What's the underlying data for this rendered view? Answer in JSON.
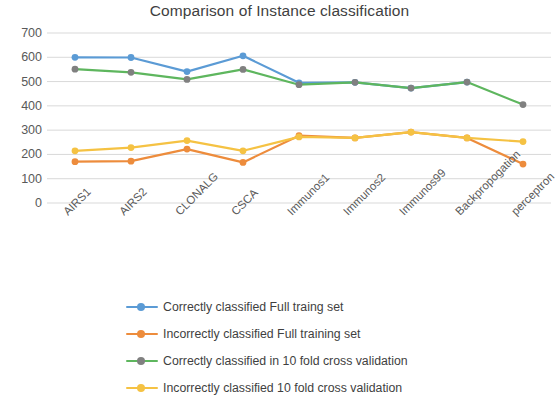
{
  "chart_data": {
    "type": "line",
    "title": "Comparison of Instance classification",
    "xlabel": "",
    "ylabel": "",
    "ylim": [
      0,
      700
    ],
    "ytick_step": 100,
    "yticks": [
      700,
      600,
      500,
      400,
      300,
      200,
      100,
      0
    ],
    "grid": true,
    "grid_axis": "y",
    "legend_position": "bottom",
    "categories": [
      "AIRS1",
      "AIRS2",
      "CLONALG",
      "CSCA",
      "Immunos1",
      "Immunos2",
      "Immunos99",
      "Backpropogation",
      "perceptron"
    ],
    "series": [
      {
        "name": "Correctly classified Full traing set",
        "color": "#5B9BD5",
        "marker_color": "#5B9BD5",
        "values": [
          600,
          599,
          541,
          606,
          495,
          497,
          473,
          498,
          null
        ]
      },
      {
        "name": "Incorrectly classified Full training set",
        "color": "#ED8C3C",
        "marker_color": "#ED8C3C",
        "values": [
          170,
          172,
          222,
          167,
          277,
          268,
          292,
          268,
          160
        ]
      },
      {
        "name": "Correctly classified in 10 fold cross validation",
        "color": "#5EB65E",
        "marker_color": "#808080",
        "values": [
          551,
          538,
          509,
          550,
          487,
          497,
          473,
          498,
          405
        ]
      },
      {
        "name": "Incorrectly classified 10 fold cross validation",
        "color": "#F5C243",
        "marker_color": "#F5C243",
        "values": [
          215,
          228,
          257,
          215,
          272,
          268,
          292,
          268,
          253
        ]
      }
    ]
  },
  "colors": {
    "series_1": "#5B9BD5",
    "series_2": "#ED8C3C",
    "series_3": "#5EB65E",
    "series_4": "#F5C243",
    "gridline": "#d9d9d9",
    "axis_text": "#595959",
    "title_text": "#3f3f3f",
    "background": "#ffffff"
  },
  "legend": {
    "items": [
      {
        "label": "Correctly classified Full traing set",
        "color": "#5B9BD5",
        "marker_color": "#5B9BD5"
      },
      {
        "label": "Incorrectly classified Full training set",
        "color": "#ED8C3C",
        "marker_color": "#ED8C3C"
      },
      {
        "label": "Correctly classified in 10 fold cross validation",
        "color": "#5EB65E",
        "marker_color": "#808080"
      },
      {
        "label": "Incorrectly classified 10 fold cross validation",
        "color": "#F5C243",
        "marker_color": "#F5C243"
      }
    ]
  }
}
